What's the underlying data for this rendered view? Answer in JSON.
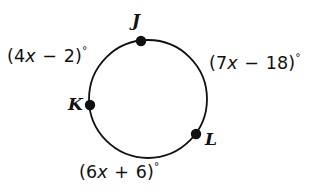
{
  "figure": {
    "type": "circle-arc-diagram",
    "background_color": "#ffffff",
    "stroke_color": "#111111",
    "text_color": "#111111"
  },
  "circle": {
    "center_x": 148,
    "center_y": 99,
    "radius": 59,
    "stroke_width": 1.8
  },
  "points": [
    {
      "id": "J",
      "label": "J",
      "cx": 141,
      "cy": 41,
      "dot_radius": 5.2
    },
    {
      "id": "K",
      "label": "K",
      "cx": 90,
      "cy": 105,
      "dot_radius": 5.2
    },
    {
      "id": "L",
      "label": "L",
      "cx": 196,
      "cy": 134,
      "dot_radius": 5.2
    }
  ],
  "arc_labels": {
    "left": {
      "full_text": "(4x − 2)°",
      "open_paren": "(",
      "coefficient": "4",
      "variable": "x",
      "operator": "−",
      "constant": "2",
      "close_paren": ")",
      "degree": "°",
      "arc": "KJ"
    },
    "right": {
      "full_text": "(7x − 18)°",
      "open_paren": "(",
      "coefficient": "7",
      "variable": "x",
      "operator": "−",
      "constant": "18",
      "close_paren": ")",
      "degree": "°",
      "arc": "JL"
    },
    "bottom": {
      "full_text": "(6x + 6)°",
      "open_paren": "(",
      "coefficient": "6",
      "variable": "x",
      "operator": "+",
      "constant": "6",
      "close_paren": ")",
      "degree": "°",
      "arc": "LK"
    }
  }
}
